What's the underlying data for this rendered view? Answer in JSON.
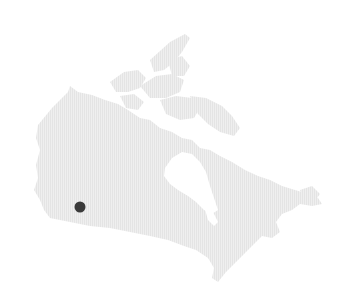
{
  "map": {
    "region": "Canada",
    "land_color": "#ebebeb",
    "stripe_color": "#e2e2e2",
    "water_color": "#ffffff",
    "markers": [
      {
        "name": "location-marker",
        "x": 80,
        "y": 207,
        "r": 5.5,
        "color": "#3a3a3a"
      }
    ]
  }
}
